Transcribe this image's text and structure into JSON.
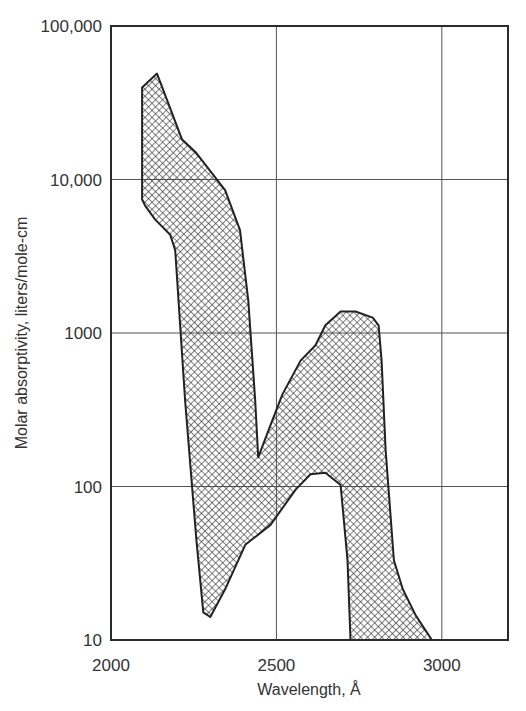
{
  "chart_data": {
    "type": "area",
    "title": "",
    "xlabel": "Wavelength, Å",
    "ylabel": "Molar absorptivity, liters/mole-cm",
    "xlim": [
      2000,
      3200
    ],
    "ylim": [
      10,
      100000
    ],
    "yscale": "log",
    "grid": true,
    "legend": null,
    "x_ticks": [
      2000,
      2500,
      3000
    ],
    "x_tick_labels": [
      "2000",
      "2500",
      "3000"
    ],
    "y_ticks": [
      10,
      100,
      1000,
      10000,
      100000
    ],
    "y_tick_labels": [
      "10",
      "100",
      "1000",
      "10,000",
      "100,000"
    ],
    "fill_pattern": "crosshatch",
    "series": [
      {
        "name": "upper envelope",
        "x": [
          2094,
          2139,
          2215,
          2255,
          2345,
          2390,
          2415,
          2436,
          2445,
          2482,
          2518,
          2573,
          2618,
          2648,
          2694,
          2739,
          2791,
          2809,
          2818,
          2830,
          2855,
          2882,
          2921,
          2970
        ],
        "log_y": [
          4.6,
          4.69,
          4.26,
          4.18,
          3.93,
          3.67,
          3.21,
          2.56,
          2.19,
          2.4,
          2.6,
          2.82,
          2.92,
          3.05,
          3.14,
          3.14,
          3.1,
          3.05,
          2.82,
          2.24,
          1.52,
          1.33,
          1.16,
          1.0
        ],
        "values": [
          40000,
          49000,
          18000,
          15000,
          8500,
          4700,
          1600,
          360,
          155,
          250,
          400,
          660,
          830,
          1120,
          1380,
          1380,
          1260,
          1120,
          660,
          175,
          33,
          21,
          14,
          10
        ]
      },
      {
        "name": "lower envelope",
        "x": [
          2724,
          2715,
          2694,
          2648,
          2603,
          2558,
          2482,
          2406,
          2345,
          2300,
          2279,
          2258,
          2224,
          2194,
          2179,
          2133,
          2103,
          2094
        ],
        "log_y": [
          1.0,
          1.52,
          2.01,
          2.09,
          2.08,
          1.98,
          1.75,
          1.62,
          1.33,
          1.15,
          1.18,
          1.65,
          2.56,
          3.54,
          3.64,
          3.74,
          3.83,
          3.87
        ],
        "values": [
          10,
          33,
          102,
          124,
          120,
          95,
          56,
          42,
          21,
          14,
          15,
          45,
          360,
          3500,
          4400,
          5500,
          6800,
          7400
        ]
      }
    ]
  },
  "layout": {
    "plot": {
      "left": 111,
      "top": 26,
      "right": 508,
      "bottom": 640
    },
    "colors": {
      "frame": "#2a2a2a",
      "grid": "#555555",
      "hatch": "#3a3a3a",
      "text": "#333333"
    }
  }
}
